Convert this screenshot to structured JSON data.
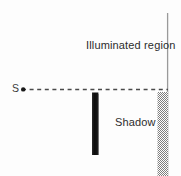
{
  "figure": {
    "background_color": "#fdfdfd",
    "width": 181,
    "height": 176,
    "labels": {
      "illuminated_region": "Illuminated region",
      "shadow": "Shadow",
      "source_point": "S"
    },
    "colors": {
      "screen_line": "#9a9a9a",
      "obstacle": "#111111",
      "ray_dash": "#4a4a4a",
      "shadow_fill": "#8c8c8c",
      "text": "#2c2c2c"
    },
    "elements": {
      "screen": {
        "name": "vertical screen line",
        "x": 167.5,
        "y_top": 13,
        "y_bottom": 176,
        "stroke_width": 1.2
      },
      "ray": {
        "name": "dashed light ray from source to screen",
        "y": 89.5,
        "x_start": 22,
        "x_end": 168,
        "dash_pattern": "4 3.5",
        "stroke_width": 1.3
      },
      "source_dot": {
        "name": "point light source S",
        "cx": 23,
        "cy": 89.5,
        "r": 2.1
      },
      "obstacle": {
        "name": "opaque vertical bar",
        "x": 92,
        "y": 92,
        "width": 6.5,
        "height": 63
      },
      "shadow_band": {
        "name": "stippled shadow region on screen",
        "x": 157.5,
        "y": 92,
        "width": 11,
        "height": 84
      }
    }
  }
}
